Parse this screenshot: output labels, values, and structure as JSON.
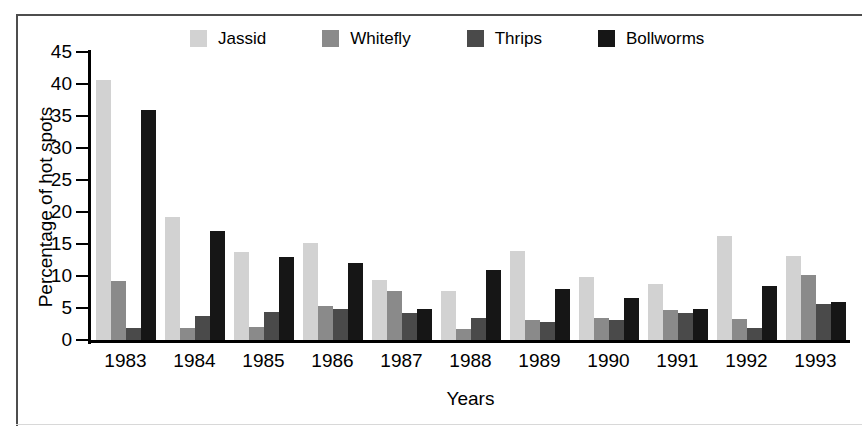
{
  "chart_data": {
    "type": "bar",
    "title": "",
    "xlabel": "Years",
    "ylabel": "Percentage of hot spots",
    "ylim": [
      0,
      45
    ],
    "yticks": [
      0,
      5,
      10,
      15,
      20,
      25,
      30,
      35,
      40,
      45
    ],
    "grid": false,
    "legend_position": "top",
    "categories": [
      "1983",
      "1984",
      "1985",
      "1986",
      "1987",
      "1988",
      "1989",
      "1990",
      "1991",
      "1992",
      "1993"
    ],
    "series": [
      {
        "name": "Jassid",
        "color": "#d2d2d2",
        "values": [
          40.7,
          19.2,
          13.8,
          15.2,
          9.3,
          7.6,
          13.9,
          9.9,
          8.8,
          16.2,
          13.2
        ]
      },
      {
        "name": "Whitefly",
        "color": "#8a8a8a",
        "values": [
          9.2,
          1.9,
          2.1,
          5.3,
          7.6,
          1.7,
          3.1,
          3.4,
          4.7,
          3.3,
          10.2
        ]
      },
      {
        "name": "Thrips",
        "color": "#4a4a4a",
        "values": [
          1.8,
          3.8,
          4.3,
          4.9,
          4.2,
          3.4,
          2.8,
          3.2,
          4.2,
          1.8,
          5.6
        ]
      },
      {
        "name": "Bollworms",
        "color": "#161616",
        "values": [
          36.0,
          17.0,
          13.0,
          12.0,
          4.8,
          11.0,
          7.9,
          6.6,
          4.9,
          8.4,
          6.0
        ]
      }
    ]
  },
  "legend": {
    "items": [
      {
        "label": "Jassid",
        "color": "#d2d2d2"
      },
      {
        "label": "Whitefly",
        "color": "#8a8a8a"
      },
      {
        "label": "Thrips",
        "color": "#4a4a4a"
      },
      {
        "label": "Bollworms",
        "color": "#161616"
      }
    ]
  },
  "axes": {
    "y_label": "Percentage of hot spots",
    "x_label": "Years",
    "y_ticks": [
      "45",
      "40",
      "35",
      "30",
      "25",
      "20",
      "15",
      "10",
      "5",
      "0"
    ],
    "x_ticks": [
      "1983",
      "1984",
      "1985",
      "1986",
      "1987",
      "1988",
      "1989",
      "1990",
      "1991",
      "1992",
      "1993"
    ]
  }
}
